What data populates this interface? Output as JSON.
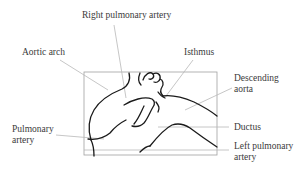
{
  "diagram": {
    "labels": {
      "right_pulmonary_artery": "Right pulmonary artery",
      "aortic_arch": "Aortic arch",
      "isthmus": "Isthmus",
      "descending_aorta_line1": "Descending",
      "descending_aorta_line2": "aorta",
      "pulmonary_artery_line1": "Pulmonary",
      "pulmonary_artery_line2": "artery",
      "ductus": "Ductus",
      "left_pulmonary_artery_line1": "Left pulmonary",
      "left_pulmonary_artery_line2": "artery"
    },
    "colors": {
      "outline": "#1a1a1a",
      "leader": "#b8b8b8",
      "frame": "#9a9a9a",
      "text": "#3a3a3a"
    }
  }
}
